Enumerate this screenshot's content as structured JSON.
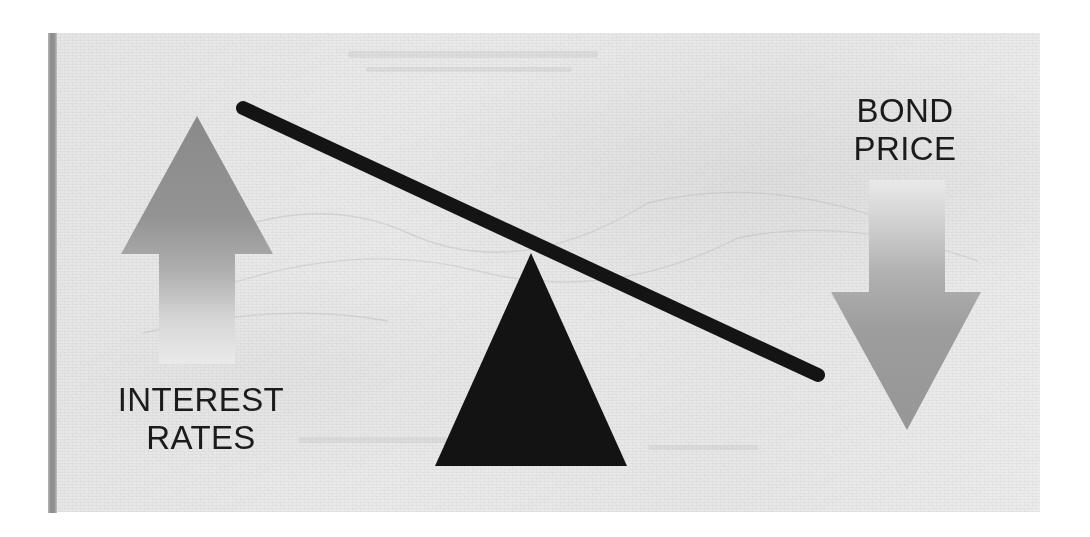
{
  "figure": {
    "type": "seesaw-balance-diagram",
    "concept": "Inverse relationship between interest rates and bond prices",
    "panel": {
      "background_color": "#e9e9e9",
      "left_rule_color": "#8c8c8c"
    },
    "labels": {
      "left": {
        "line1": "INTEREST",
        "line2": "RATES",
        "color": "#1b1b1b"
      },
      "right": {
        "line1": "BOND",
        "line2": "PRICE",
        "color": "#1b1b1b"
      }
    },
    "arrows": {
      "left": {
        "name": "up-arrow",
        "direction": "up",
        "meaning": "interest rates rising",
        "color_top": "#8e8e8e",
        "color_bottom": "#e9e9e9"
      },
      "right": {
        "name": "down-arrow",
        "direction": "down",
        "meaning": "bond price falling",
        "color_top": "#e9e9e9",
        "color_bottom": "#9a9a9a"
      }
    },
    "lever": {
      "name": "tilted-beam",
      "color": "#141414",
      "thickness_px": 14,
      "tilt": "down-to-the-right",
      "left_end": [
        243,
        108
      ],
      "right_end": [
        818,
        375
      ]
    },
    "fulcrum": {
      "name": "triangle-fulcrum",
      "color": "#131313",
      "apex": [
        531,
        253
      ],
      "base_left": [
        440,
        466
      ],
      "base_right": [
        627,
        466
      ]
    }
  }
}
